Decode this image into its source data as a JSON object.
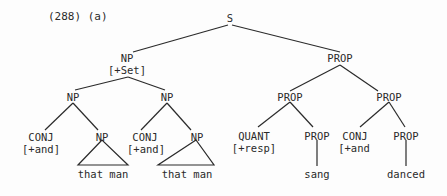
{
  "example_label": "(288) (a)",
  "tree": {
    "root": "S",
    "np_top": {
      "label": "NP",
      "feature": "[+Set]"
    },
    "np_left": "NP",
    "np_right": "NP",
    "conj1": {
      "label": "CONJ",
      "feature": "[+and]"
    },
    "np1": {
      "label": "NP",
      "leaf": "that man"
    },
    "conj2": {
      "label": "CONJ",
      "feature": "[+and]"
    },
    "np2": {
      "label": "NP",
      "leaf": "that man"
    },
    "prop_top": "PROP",
    "prop_left": "PROP",
    "prop_right": "PROP",
    "quant": {
      "label": "QUANT",
      "feature": "[+resp]"
    },
    "prop1": {
      "label": "PROP",
      "leaf": "sang"
    },
    "conj3": {
      "label": "CONJ",
      "feature": "[+and"
    },
    "prop2": {
      "label": "PROP",
      "leaf": "danced"
    }
  },
  "colors": {
    "ink": "#2a2a2a",
    "background": "#fdfdfd"
  }
}
